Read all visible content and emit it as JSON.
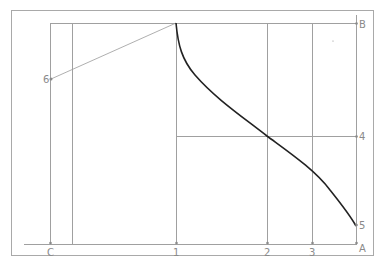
{
  "diagram": {
    "type": "construction-curve",
    "colors": {
      "lines": "#a0a0a0",
      "curve": "#222222",
      "labels": "#8a8a8a"
    },
    "labels": {
      "C": "C",
      "p1": "1",
      "p2": "2",
      "p3": "3",
      "p4": "4",
      "p5": "5",
      "p6": "6",
      "A": "A",
      "B": "B"
    },
    "points": [
      {
        "id": "C",
        "x": 50,
        "y": 244
      },
      {
        "id": "1",
        "x": 176,
        "y": 244
      },
      {
        "id": "2",
        "x": 267,
        "y": 244
      },
      {
        "id": "3",
        "x": 312,
        "y": 244
      },
      {
        "id": "A",
        "x": 356,
        "y": 244
      },
      {
        "id": "B",
        "x": 356,
        "y": 23
      },
      {
        "id": "4",
        "x": 356,
        "y": 136
      },
      {
        "id": "5",
        "x": 356,
        "y": 225
      },
      {
        "id": "6",
        "x": 51,
        "y": 79
      }
    ]
  }
}
